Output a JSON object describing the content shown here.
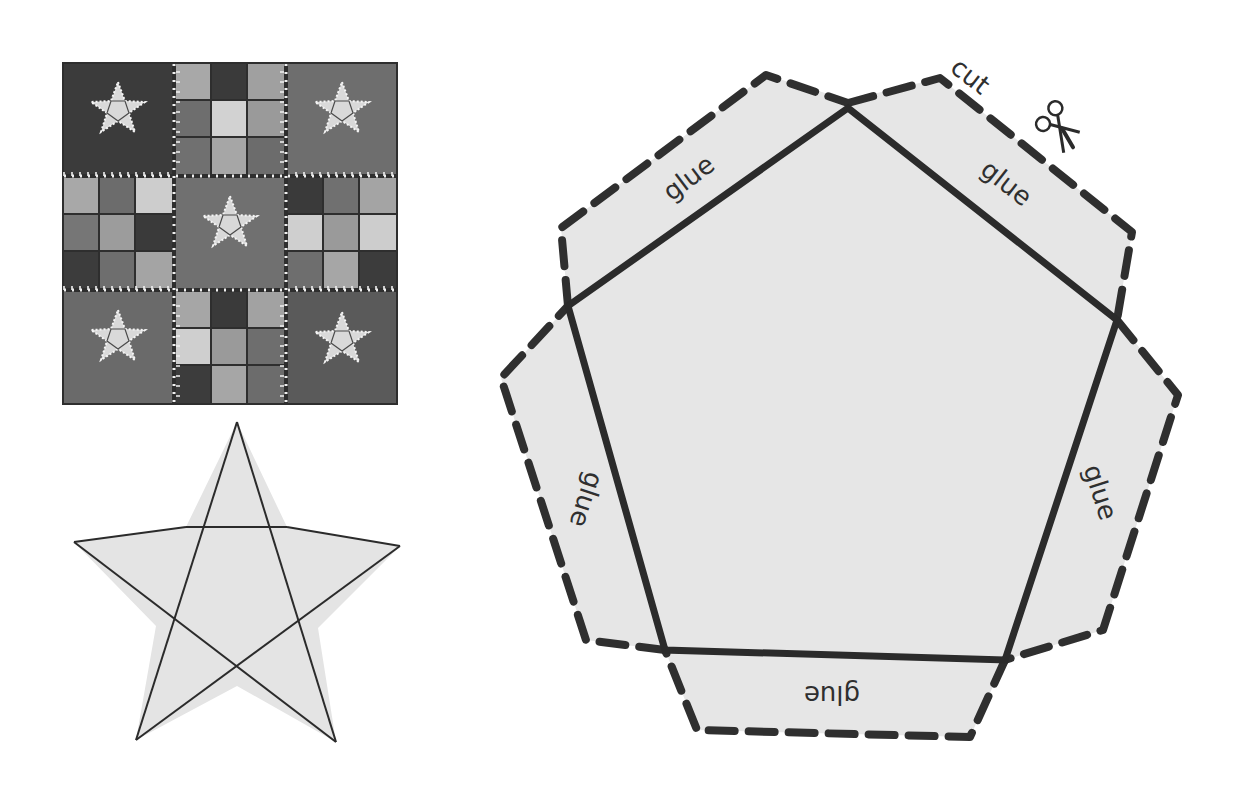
{
  "figure": {
    "quilt": {
      "grid": "3x3",
      "block_types": [
        "star-block",
        "nine-patch-block"
      ],
      "colors": {
        "dark": "#3a3a3a",
        "mid_dark": "#585858",
        "mid": "#7a7a7a",
        "light": "#a6a6a6",
        "lighter": "#c9c9c9",
        "star_fill": "#d9d9d9",
        "stitch": "#f2f2f2"
      }
    },
    "star_template": {
      "fill": "#e4e4e4",
      "stroke": "#2b2b2b"
    },
    "pentagon_template": {
      "fill": "#e6e6e6",
      "stroke": "#2b2b2b",
      "labels": {
        "top_left": "glue",
        "top_right": "glue",
        "left": "glue",
        "right": "glue",
        "bottom": "glue",
        "cut": "cut"
      },
      "icons": [
        "scissors-icon"
      ]
    }
  }
}
